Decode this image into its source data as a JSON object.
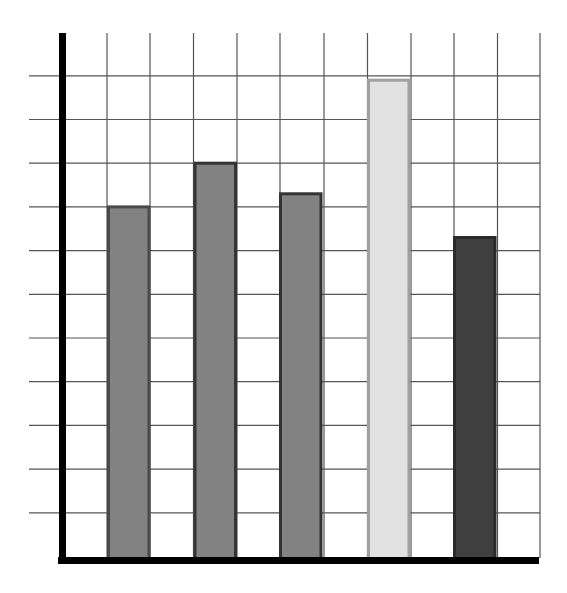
{
  "chart_data": {
    "type": "bar",
    "title": "",
    "xlabel": "",
    "ylabel": "",
    "categories": [
      "1",
      "2",
      "3",
      "4",
      "5"
    ],
    "values": [
      8,
      9,
      8.3,
      10.9,
      7.3
    ],
    "ylim": [
      0,
      12
    ],
    "grid": true,
    "legend": null,
    "tick_labels_shown": false,
    "bar_fills": [
      "#828282",
      "#828282",
      "#828282",
      "#e2e2e2",
      "#3f3f3f"
    ],
    "bar_strokes": [
      "#4a4a4a",
      "#333333",
      "#333333",
      "#a0a0a0",
      "#2a2a2a"
    ]
  },
  "layout": {
    "axis_color": "#000000",
    "grid_color": "#555555"
  }
}
